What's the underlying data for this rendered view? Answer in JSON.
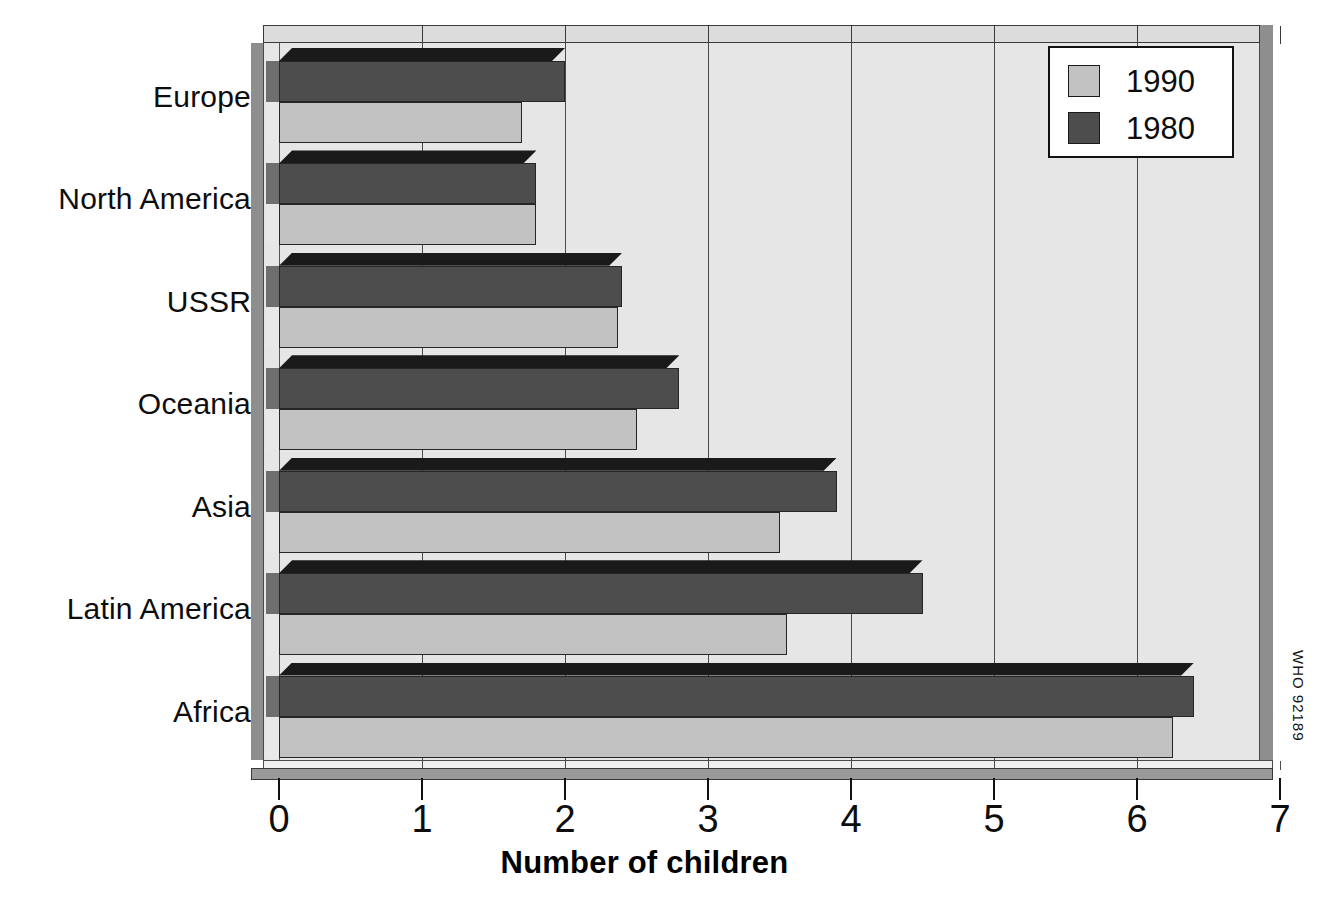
{
  "chart_data": {
    "type": "bar",
    "orientation": "horizontal",
    "title": "",
    "subtitle": "",
    "xlabel": "Number of children",
    "ylabel": "",
    "xlim": [
      0,
      7
    ],
    "xticks": [
      "0",
      "1",
      "2",
      "3",
      "4",
      "5",
      "6",
      "7"
    ],
    "grid": true,
    "grid_axis": "x",
    "legend_position": "top-right",
    "categories": [
      "Europe",
      "North America",
      "USSR",
      "Oceania",
      "Asia",
      "Latin America",
      "Africa"
    ],
    "series": [
      {
        "name": "1990",
        "color": "#c2c2c2",
        "values": [
          1.7,
          1.8,
          2.37,
          2.5,
          3.5,
          3.55,
          6.25
        ]
      },
      {
        "name": "1980",
        "color": "#4d4d4d",
        "values": [
          2.0,
          1.8,
          2.4,
          2.8,
          3.9,
          4.5,
          6.4
        ]
      }
    ],
    "annotations": [
      "WHO 92189"
    ]
  },
  "legend": {
    "entries": [
      {
        "label": "1990",
        "color": "#c2c2c2"
      },
      {
        "label": "1980",
        "color": "#4d4d4d"
      }
    ]
  },
  "axis": {
    "x_title": "Number of children",
    "x_tick_labels": [
      "0",
      "1",
      "2",
      "3",
      "4",
      "5",
      "6",
      "7"
    ]
  },
  "categories": {
    "labels": [
      "Europe",
      "North America",
      "USSR",
      "Oceania",
      "Asia",
      "Latin America",
      "Africa"
    ]
  },
  "credit": {
    "text": "WHO 92189"
  },
  "colors": {
    "series_1990": "#c2c2c2",
    "series_1980": "#4d4d4d",
    "plot_background": "#e6e6e6",
    "wall": "#8e8e8e",
    "gridline": "#4a4a4a",
    "page_background": "#ffffff"
  }
}
